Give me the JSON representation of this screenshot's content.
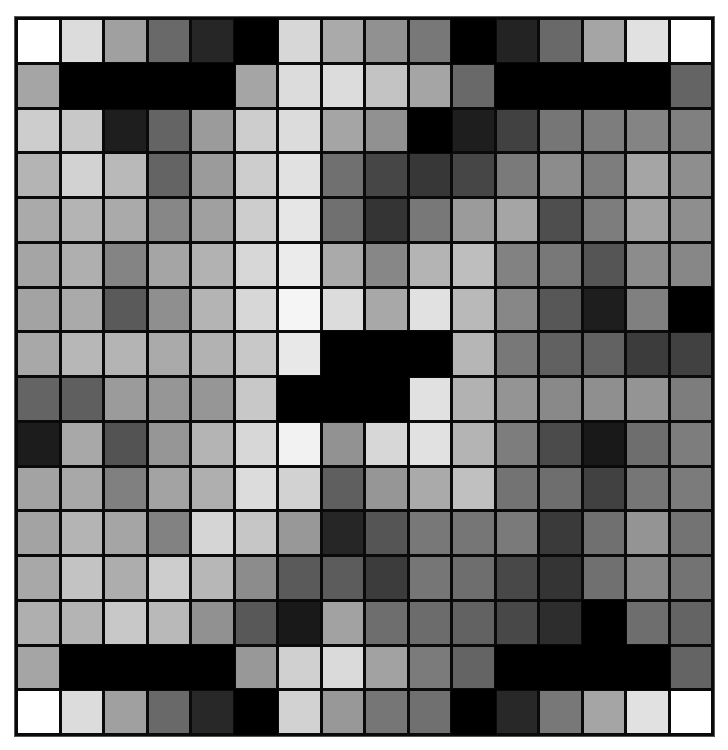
{
  "chart_data": {
    "type": "heatmap",
    "title": "",
    "rows": 16,
    "cols": 16,
    "value_range": [
      0,
      255
    ],
    "colormap": "grayscale (0=black, 255=white)",
    "values": [
      [
        255,
        220,
        160,
        105,
        38,
        0,
        215,
        170,
        145,
        120,
        0,
        35,
        105,
        165,
        225,
        255
      ],
      [
        165,
        0,
        0,
        0,
        0,
        165,
        220,
        220,
        195,
        165,
        105,
        0,
        0,
        0,
        0,
        100
      ],
      [
        205,
        200,
        30,
        100,
        155,
        205,
        220,
        165,
        145,
        0,
        30,
        65,
        118,
        125,
        132,
        128
      ],
      [
        180,
        210,
        185,
        100,
        155,
        205,
        225,
        112,
        70,
        55,
        70,
        122,
        140,
        125,
        165,
        142
      ],
      [
        170,
        180,
        170,
        135,
        160,
        205,
        230,
        112,
        52,
        120,
        155,
        165,
        78,
        125,
        162,
        142
      ],
      [
        165,
        175,
        132,
        165,
        178,
        215,
        235,
        170,
        135,
        180,
        190,
        130,
        120,
        85,
        140,
        135
      ],
      [
        163,
        170,
        90,
        143,
        180,
        215,
        245,
        220,
        168,
        225,
        185,
        135,
        87,
        30,
        128,
        0
      ],
      [
        168,
        183,
        180,
        170,
        178,
        200,
        232,
        0,
        0,
        0,
        182,
        120,
        97,
        98,
        60,
        65
      ],
      [
        100,
        95,
        155,
        150,
        150,
        200,
        0,
        0,
        0,
        225,
        178,
        148,
        137,
        143,
        148,
        125
      ],
      [
        28,
        168,
        83,
        150,
        180,
        215,
        242,
        146,
        215,
        225,
        180,
        125,
        75,
        25,
        110,
        125
      ],
      [
        163,
        168,
        128,
        163,
        175,
        220,
        210,
        95,
        150,
        170,
        192,
        115,
        110,
        65,
        118,
        123
      ],
      [
        163,
        180,
        165,
        130,
        213,
        198,
        152,
        38,
        85,
        120,
        118,
        122,
        58,
        112,
        148,
        115
      ],
      [
        168,
        195,
        173,
        205,
        183,
        140,
        90,
        92,
        60,
        118,
        110,
        72,
        52,
        112,
        135,
        115
      ],
      [
        175,
        180,
        200,
        185,
        145,
        88,
        25,
        162,
        110,
        108,
        98,
        72,
        45,
        0,
        110,
        100
      ],
      [
        165,
        0,
        0,
        0,
        0,
        152,
        208,
        218,
        162,
        123,
        100,
        0,
        0,
        0,
        0,
        100
      ],
      [
        255,
        220,
        160,
        105,
        40,
        0,
        210,
        152,
        118,
        112,
        0,
        40,
        120,
        165,
        225,
        255
      ]
    ],
    "xlabel": "",
    "ylabel": "",
    "grid": true
  }
}
